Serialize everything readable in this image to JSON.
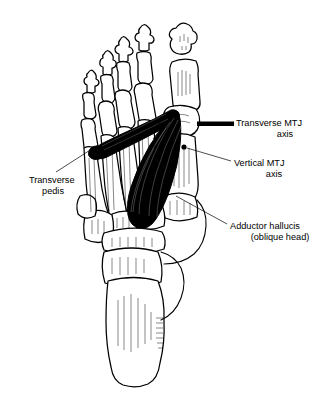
{
  "figure": {
    "background_color": "#ffffff",
    "line_color": "#000000",
    "muscle_fill_color": "#000000",
    "bone_fill_color": "#ffffff"
  },
  "labels": {
    "transverse_mtj": {
      "line1": "Transverse MTJ",
      "line2": "axis"
    },
    "vertical_mtj": {
      "line1": "Vertical MTJ",
      "line2": "axis"
    },
    "adductor": {
      "line1": "Adductor hallucis",
      "line2": "(oblique head)"
    },
    "transverse_pedis": {
      "line1": "Transverse",
      "line2": "pedis"
    }
  },
  "markers": {
    "transverse_axis_bar": "thick-black-bar",
    "vertical_axis_dot": "small-black-dot"
  },
  "bones": {
    "phalanges": "distal, middle and proximal phalanges of toes 1-5",
    "metatarsals": "first through fifth metatarsals",
    "tarsals": "cuneiforms, cuboid, navicular, talus, calcaneus"
  }
}
